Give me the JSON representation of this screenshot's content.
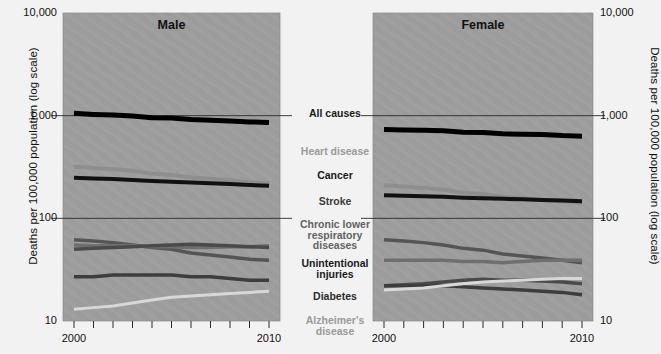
{
  "figure": {
    "left_axis_title": "Deaths per 100,000 population (log scale)",
    "right_axis_title": "Deaths per 100,000 population (log scale)",
    "background_color": "#f2f2f2",
    "panel_color": "#9d9d9d"
  },
  "chart_data": {
    "type": "line",
    "title": "",
    "xlabel": "",
    "ylabel": "Deaths per 100,000 population (log scale)",
    "yscale": "log",
    "ylim": [
      10,
      10000
    ],
    "ytick_labels": [
      "10,000",
      "1,000",
      "100",
      "10"
    ],
    "ytick_values": [
      10000,
      1000,
      100,
      10
    ],
    "grid": "horizontal gridlines at 1,000 and 100",
    "xlim": [
      2000,
      2010
    ],
    "x": [
      2000,
      2001,
      2002,
      2003,
      2004,
      2005,
      2006,
      2007,
      2008,
      2009,
      2010
    ],
    "xtick_labels": [
      "2000",
      "2010"
    ],
    "xtick_label_values": [
      2000,
      2010
    ],
    "n_xticks": 11,
    "legend_position": "center between panels",
    "panels": [
      {
        "name": "Male",
        "title": "Male",
        "series": [
          {
            "name": "All causes",
            "color": "#000000",
            "width": 5.0,
            "values": [
              1054,
              1029,
              1014,
              993,
              955,
              948,
              917,
              902,
              888,
              870,
              857
            ]
          },
          {
            "name": "Heart disease",
            "color": "#8e8e8e",
            "width": 4.0,
            "values": [
              320,
              310,
              300,
              290,
              273,
              265,
              250,
              243,
              235,
              225,
              219
            ]
          },
          {
            "name": "Cancer",
            "color": "#111111",
            "width": 4.0,
            "values": [
              248,
              245,
              241,
              236,
              231,
              227,
              223,
              220,
              216,
              211,
              208
            ]
          },
          {
            "name": "Stroke",
            "color": "#555555",
            "width": 3.5,
            "values": [
              62,
              60,
              58,
              55,
              52,
              50,
              46,
              44,
              42,
              40,
              39
            ]
          },
          {
            "name": "Chronic lower respiratory diseases",
            "color": "#6f6f6f",
            "width": 3.5,
            "values": [
              55,
              54,
              54,
              54,
              53,
              53,
              52,
              52,
              53,
              53,
              54
            ]
          },
          {
            "name": "Unintentional injuries",
            "color": "#4a4a4a",
            "width": 3.5,
            "values": [
              50,
              51,
              52,
              53,
              54,
              55,
              56,
              55,
              54,
              53,
              52
            ]
          },
          {
            "name": "Diabetes",
            "color": "#3d3d3d",
            "width": 3.5,
            "values": [
              27,
              27,
              28,
              28,
              28,
              28,
              27,
              27,
              26,
              25,
              25
            ]
          },
          {
            "name": "Alzheimer's disease",
            "color": "#d8d8d8",
            "width": 3.0,
            "values": [
              13,
              13.5,
              14,
              15,
              16,
              17,
              17.5,
              18,
              18.5,
              19,
              19.5
            ]
          }
        ]
      },
      {
        "name": "Female",
        "title": "Female",
        "series": [
          {
            "name": "All causes",
            "color": "#000000",
            "width": 5.0,
            "values": [
              735,
              726,
              720,
              712,
              690,
              686,
              665,
              660,
              655,
              640,
              632
            ]
          },
          {
            "name": "Heart disease",
            "color": "#8e8e8e",
            "width": 4.0,
            "values": [
              210,
              204,
              198,
              190,
              178,
              172,
              162,
              157,
              152,
              146,
              141
            ]
          },
          {
            "name": "Cancer",
            "color": "#111111",
            "width": 4.0,
            "values": [
              168,
              166,
              164,
              162,
              159,
              157,
              155,
              153,
              151,
              149,
              147
            ]
          },
          {
            "name": "Stroke",
            "color": "#555555",
            "width": 3.5,
            "values": [
              62,
              60,
              58,
              55,
              51,
              49,
              45,
              43,
              41,
              39,
              37
            ]
          },
          {
            "name": "Chronic lower respiratory diseases",
            "color": "#6f6f6f",
            "width": 3.5,
            "values": [
              39,
              39,
              39,
              39,
              38,
              38,
              37,
              38,
              39,
              39,
              39
            ]
          },
          {
            "name": "Unintentional injuries",
            "color": "#4a4a4a",
            "width": 3.5,
            "values": [
              22,
              22.5,
              23,
              24,
              25,
              25.5,
              25,
              25,
              24.5,
              24,
              23
            ]
          },
          {
            "name": "Diabetes",
            "color": "#3d3d3d",
            "width": 3.5,
            "values": [
              22,
              22,
              22,
              22,
              21.5,
              21,
              20.5,
              20,
              19.5,
              19,
              18
            ]
          },
          {
            "name": "Alzheimer's disease",
            "color": "#d8d8d8",
            "width": 3.0,
            "values": [
              20,
              20.5,
              21,
              22,
              23,
              24,
              24.5,
              25,
              25.5,
              26,
              26
            ]
          }
        ]
      }
    ],
    "legend_entries": [
      {
        "label": "All causes",
        "color": "#1a1a1a"
      },
      {
        "label": "Heart disease",
        "color": "#9a9a9a"
      },
      {
        "label": "Cancer",
        "color": "#1a1a1a"
      },
      {
        "label": "Stroke",
        "color": "#3b3b3b"
      },
      {
        "label": "Chronic lower\nrespiratory\ndiseases",
        "color": "#636363"
      },
      {
        "label": "Unintentional\ninjuries",
        "color": "#1a1a1a"
      },
      {
        "label": "Diabetes",
        "color": "#2b2b2b"
      },
      {
        "label": "Alzheimer's\ndisease",
        "color": "#9a9a9a"
      }
    ]
  }
}
